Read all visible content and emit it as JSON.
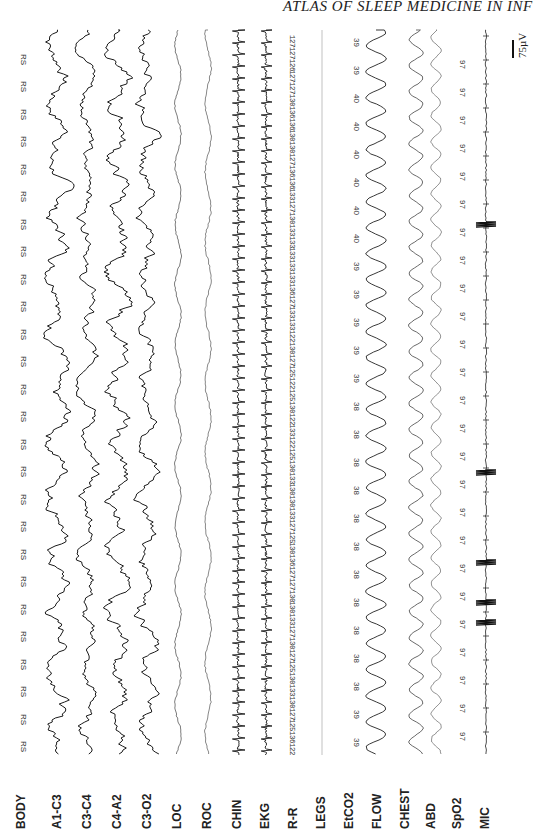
{
  "running_head": "ATLAS OF SLEEP MEDICINE IN INF",
  "scale_label": "75µV",
  "channels": [
    {
      "key": "body",
      "label": "BODY",
      "x": 22
    },
    {
      "key": "a1c3",
      "label": "A1-C3",
      "x": 58
    },
    {
      "key": "c3c4",
      "label": "C3-C4",
      "x": 88
    },
    {
      "key": "c4a2",
      "label": "C4-A2",
      "x": 118
    },
    {
      "key": "c3o2",
      "label": "C3-O2",
      "x": 148
    },
    {
      "key": "loc",
      "label": "LOC",
      "x": 178
    },
    {
      "key": "roc",
      "label": "ROC",
      "x": 208
    },
    {
      "key": "chin",
      "label": "CHIN",
      "x": 238
    },
    {
      "key": "ekg",
      "label": "EKG",
      "x": 266
    },
    {
      "key": "rr",
      "label": "R-R",
      "x": 294
    },
    {
      "key": "legs",
      "label": "LEGS",
      "x": 322
    },
    {
      "key": "etco2",
      "label": "EtCO2",
      "x": 350
    },
    {
      "key": "flow",
      "label": "FLOW",
      "x": 378
    },
    {
      "key": "chest",
      "label": "CHEST",
      "x": 406
    },
    {
      "key": "abd",
      "label": "ABD",
      "x": 432
    },
    {
      "key": "spo2",
      "label": "SpO2",
      "x": 458
    },
    {
      "key": "mic",
      "label": "MIC",
      "x": 486
    }
  ],
  "body_position": {
    "label_value": "RS",
    "count": 26
  },
  "rr_intervals": [
    "122",
    "136",
    "125",
    "127",
    "130",
    "133",
    "130",
    "125",
    "127",
    "130",
    "127",
    "133",
    "130",
    "130",
    "127",
    "127",
    "136",
    "130",
    "125",
    "127",
    "133",
    "130",
    "130",
    "133",
    "130",
    "125",
    "122",
    "133",
    "122",
    "130",
    "125",
    "122",
    "125",
    "127",
    "130",
    "122",
    "133",
    "133",
    "127",
    "136",
    "133",
    "133",
    "133",
    "133",
    "133",
    "130",
    "127",
    "133",
    "136",
    "136",
    "127",
    "130",
    "130",
    "136",
    "136",
    "130",
    "127",
    "127",
    "126",
    "127",
    "127"
  ],
  "etco2_values": [
    "39",
    "39",
    "38",
    "38",
    "38",
    "38",
    "38",
    "38",
    "38",
    "38",
    "38",
    "38",
    "38",
    "39",
    "39",
    "39",
    "39",
    "39",
    "40",
    "40",
    "40",
    "40",
    "40",
    "40",
    "39",
    "39"
  ],
  "spo2_values": [
    "97",
    "97",
    "97",
    "97",
    "97",
    "97",
    "97",
    "97",
    "97",
    "97",
    "97",
    "97",
    "97",
    "97",
    "97",
    "97",
    "97",
    "97",
    "97",
    "97",
    "97",
    "97",
    "97",
    "97",
    "97"
  ],
  "mic_artifacts_y": [
    222,
    470,
    560,
    600,
    620
  ],
  "colors": {
    "trace": "#1a1a1a",
    "faint_trace": "#777777",
    "text": "#222222"
  }
}
